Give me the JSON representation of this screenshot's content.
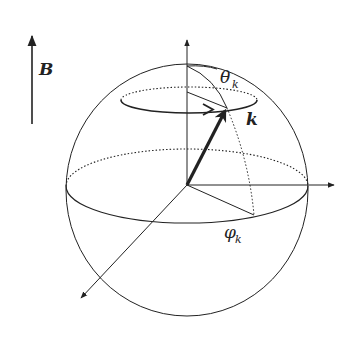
{
  "diagram": {
    "type": "sphere-vector-diagram",
    "labels": {
      "field": "B",
      "vector": "k",
      "polar_angle": "θ",
      "polar_angle_sub": "k",
      "azimuth_angle": "φ",
      "azimuth_angle_sub": "k"
    },
    "elements": [
      "magnetic field arrow B (vertical, upward)",
      "sphere",
      "vertical axis",
      "horizontal axis",
      "diagonal axis",
      "equator (dotted back, solid front)",
      "latitude circle with arrow",
      "vector k (bold arrow)",
      "meridian arc through k",
      "projection of k onto equatorial plane"
    ],
    "colors": {
      "stroke": "#222222",
      "background": "#ffffff"
    }
  }
}
